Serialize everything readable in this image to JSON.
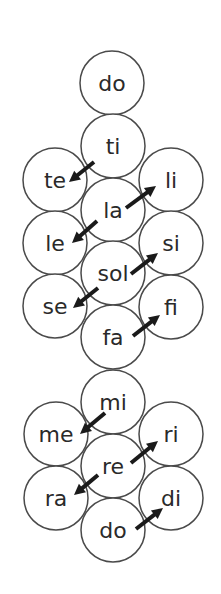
{
  "diagram": {
    "circle_radius": 32,
    "colors": {
      "stroke": "#4a4a4a",
      "text": "#2a2a2a",
      "arrow": "#1a1a1a",
      "background": "#ffffff"
    },
    "nodes": [
      {
        "id": "do_top",
        "label": "do",
        "cx": 112,
        "cy": 83
      },
      {
        "id": "ti",
        "label": "ti",
        "cx": 113,
        "cy": 146
      },
      {
        "id": "te",
        "label": "te",
        "cx": 55,
        "cy": 180
      },
      {
        "id": "li",
        "label": "li",
        "cx": 171,
        "cy": 180
      },
      {
        "id": "la",
        "label": "la",
        "cx": 113,
        "cy": 210
      },
      {
        "id": "le",
        "label": "le",
        "cx": 55,
        "cy": 243
      },
      {
        "id": "si",
        "label": "si",
        "cx": 171,
        "cy": 243
      },
      {
        "id": "sol",
        "label": "sol",
        "cx": 113,
        "cy": 273
      },
      {
        "id": "se",
        "label": "se",
        "cx": 55,
        "cy": 306
      },
      {
        "id": "fi",
        "label": "fi",
        "cx": 171,
        "cy": 307
      },
      {
        "id": "fa",
        "label": "fa",
        "cx": 113,
        "cy": 337
      },
      {
        "id": "mi",
        "label": "mi",
        "cx": 113,
        "cy": 402
      },
      {
        "id": "me",
        "label": "me",
        "cx": 56,
        "cy": 434
      },
      {
        "id": "ri",
        "label": "ri",
        "cx": 171,
        "cy": 434
      },
      {
        "id": "re",
        "label": "re",
        "cx": 113,
        "cy": 466
      },
      {
        "id": "ra",
        "label": "ra",
        "cx": 56,
        "cy": 498
      },
      {
        "id": "di",
        "label": "di",
        "cx": 171,
        "cy": 498
      },
      {
        "id": "do_bottom",
        "label": "do",
        "cx": 113,
        "cy": 530
      }
    ],
    "arrows": [
      {
        "from": "ti",
        "to": "te",
        "x1": 94,
        "y1": 162,
        "x2": 69,
        "y2": 182
      },
      {
        "from": "la",
        "to": "li",
        "x1": 126,
        "y1": 208,
        "x2": 156,
        "y2": 186
      },
      {
        "from": "la",
        "to": "le",
        "x1": 97,
        "y1": 221,
        "x2": 72,
        "y2": 243
      },
      {
        "from": "sol",
        "to": "si",
        "x1": 131,
        "y1": 274,
        "x2": 158,
        "y2": 253
      },
      {
        "from": "sol",
        "to": "se",
        "x1": 98,
        "y1": 288,
        "x2": 73,
        "y2": 308
      },
      {
        "from": "fa",
        "to": "fi",
        "x1": 133,
        "y1": 336,
        "x2": 160,
        "y2": 315
      },
      {
        "from": "mi",
        "to": "me",
        "x1": 105,
        "y1": 413,
        "x2": 80,
        "y2": 434
      },
      {
        "from": "re",
        "to": "ri",
        "x1": 131,
        "y1": 463,
        "x2": 158,
        "y2": 441
      },
      {
        "from": "re",
        "to": "ra",
        "x1": 98,
        "y1": 475,
        "x2": 74,
        "y2": 495
      },
      {
        "from": "do_bottom",
        "to": "di",
        "x1": 136,
        "y1": 529,
        "x2": 163,
        "y2": 508
      }
    ]
  }
}
